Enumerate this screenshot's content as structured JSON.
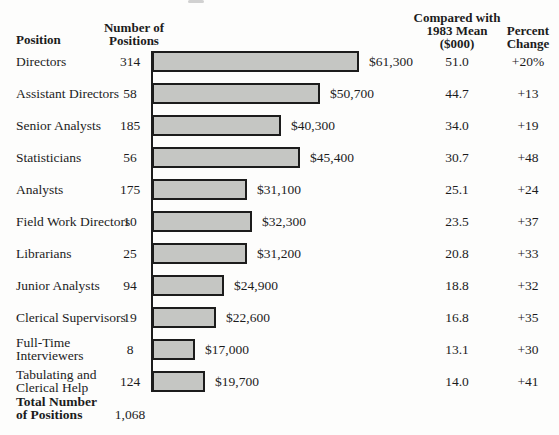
{
  "header": {
    "position": "Position",
    "number_lines": [
      "Number of",
      "Positions"
    ],
    "compared_lines": [
      "Compared with",
      "1983 Mean",
      "($000)"
    ],
    "percent_lines": [
      "Percent",
      "Change"
    ]
  },
  "chart_data": {
    "type": "bar",
    "title": "",
    "orientation": "horizontal",
    "columns": [
      "Position",
      "Number of Positions",
      "Salary",
      "Compared with 1983 Mean ($000)",
      "Percent Change"
    ],
    "bar_color": "#c5c6c3",
    "bar_border_color": "#1c1c1c",
    "rows": [
      {
        "position": "Directors",
        "position_lines": [
          "Directors"
        ],
        "num_positions": "314",
        "salary_label": "$61,300",
        "salary_value": 61300,
        "compared_1983_mean": "51.0",
        "percent_change": "+20%"
      },
      {
        "position": "Assistant Directors",
        "position_lines": [
          "Assistant Directors"
        ],
        "num_positions": "58",
        "salary_label": "$50,700",
        "salary_value": 50700,
        "compared_1983_mean": "44.7",
        "percent_change": "+13"
      },
      {
        "position": "Senior Analysts",
        "position_lines": [
          "Senior Analysts"
        ],
        "num_positions": "185",
        "salary_label": "$40,300",
        "salary_value": 40300,
        "compared_1983_mean": "34.0",
        "percent_change": "+19"
      },
      {
        "position": "Statisticians",
        "position_lines": [
          "Statisticians"
        ],
        "num_positions": "56",
        "salary_label": "$45,400",
        "salary_value": 45400,
        "compared_1983_mean": "30.7",
        "percent_change": "+48"
      },
      {
        "position": "Analysts",
        "position_lines": [
          "Analysts"
        ],
        "num_positions": "175",
        "salary_label": "$31,100",
        "salary_value": 31100,
        "compared_1983_mean": "25.1",
        "percent_change": "+24"
      },
      {
        "position": "Field Work Directors",
        "position_lines": [
          "Field Work Directors"
        ],
        "num_positions": "10",
        "salary_label": "$32,300",
        "salary_value": 32300,
        "compared_1983_mean": "23.5",
        "percent_change": "+37"
      },
      {
        "position": "Librarians",
        "position_lines": [
          "Librarians"
        ],
        "num_positions": "25",
        "salary_label": "$31,200",
        "salary_value": 31200,
        "compared_1983_mean": "20.8",
        "percent_change": "+33"
      },
      {
        "position": "Junior Analysts",
        "position_lines": [
          "Junior Analysts"
        ],
        "num_positions": "94",
        "salary_label": "$24,900",
        "salary_value": 24900,
        "compared_1983_mean": "18.8",
        "percent_change": "+32"
      },
      {
        "position": "Clerical Supervisors",
        "position_lines": [
          "Clerical Supervisors"
        ],
        "num_positions": "19",
        "salary_label": "$22,600",
        "salary_value": 22600,
        "compared_1983_mean": "16.8",
        "percent_change": "+35"
      },
      {
        "position": "Full-Time Interviewers",
        "position_lines": [
          "Full-Time",
          "Interviewers"
        ],
        "num_positions": "8",
        "salary_label": "$17,000",
        "salary_value": 17000,
        "compared_1983_mean": "13.1",
        "percent_change": "+30"
      },
      {
        "position": "Tabulating and Clerical Help",
        "position_lines": [
          "Tabulating and",
          "Clerical Help"
        ],
        "num_positions": "124",
        "salary_label": "$19,700",
        "salary_value": 19700,
        "compared_1983_mean": "14.0",
        "percent_change": "+41"
      }
    ],
    "total": {
      "label_lines": [
        "Total Number",
        "of Positions"
      ],
      "value": "1,068"
    }
  }
}
